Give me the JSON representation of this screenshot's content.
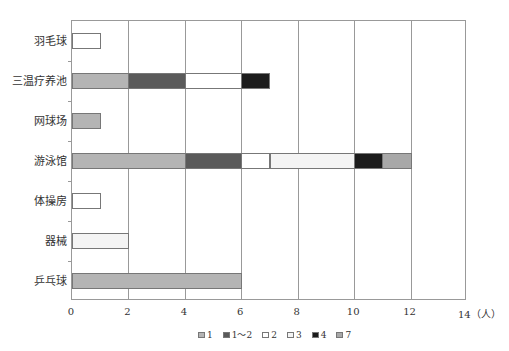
{
  "chart_data": {
    "type": "bar",
    "orientation": "horizontal",
    "stacked": true,
    "title": "",
    "xlabel": "（人）",
    "ylabel": "",
    "xlim": [
      0,
      14
    ],
    "x_ticks": [
      "0",
      "2",
      "4",
      "6",
      "8",
      "10",
      "12",
      "14"
    ],
    "x_unit_label": "14（人）",
    "grid": true,
    "legend_position": "bottom",
    "categories": [
      "羽毛球",
      "三温疗养池",
      "网球场",
      "游泳馆",
      "体操房",
      "器械",
      "乒乓球"
    ],
    "legend": [
      {
        "name": "1",
        "color": "#b4b4b4"
      },
      {
        "name": "1～2",
        "color": "#5a5a5a"
      },
      {
        "name": "2",
        "color": "#ffffff"
      },
      {
        "name": "3",
        "color": "#f4f4f4"
      },
      {
        "name": "4",
        "color": "#1c1c1c"
      },
      {
        "name": "7",
        "color": "#a8a8a8"
      }
    ],
    "series": [
      {
        "name": "1",
        "values": [
          0,
          2,
          1,
          4,
          0,
          0,
          6
        ]
      },
      {
        "name": "1～2",
        "values": [
          0,
          2,
          0,
          2,
          0,
          0,
          0
        ]
      },
      {
        "name": "2",
        "values": [
          1,
          2,
          0,
          1,
          1,
          0,
          0
        ]
      },
      {
        "name": "3",
        "values": [
          0,
          0,
          0,
          3,
          0,
          2,
          0
        ]
      },
      {
        "name": "4",
        "values": [
          0,
          1,
          0,
          1,
          0,
          0,
          0
        ]
      },
      {
        "name": "7",
        "values": [
          0,
          0,
          0,
          1,
          0,
          0,
          0
        ]
      }
    ],
    "totals": [
      1,
      7,
      1,
      12,
      1,
      2,
      6
    ]
  }
}
